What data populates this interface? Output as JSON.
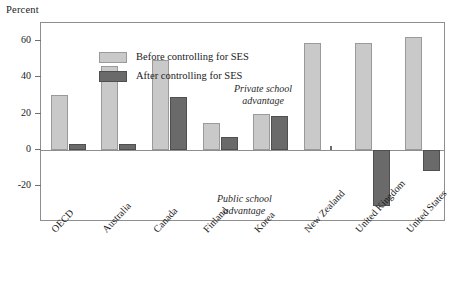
{
  "chart_data": {
    "type": "bar",
    "title": "",
    "subtitle": "",
    "xlabel": "",
    "ylabel": "Percent",
    "ylim": [
      -40,
      70
    ],
    "yticks": [
      60,
      40,
      20,
      0,
      -20
    ],
    "ytick_labels": [
      "60",
      "40",
      "20",
      "0",
      "-20"
    ],
    "grid": false,
    "legend_position": "top-left-inside",
    "categories": [
      "OECD",
      "Australia",
      "Canada",
      "Finland",
      "Korea",
      "New Zealand",
      "United Kingdom",
      "United States"
    ],
    "series": [
      {
        "name": "Before controlling for SES",
        "color": "#c9c9c9",
        "values": [
          30,
          46,
          49.5,
          14.5,
          19.5,
          59,
          59,
          62.5
        ]
      },
      {
        "name": "After controlling for SES",
        "color": "#6a6a6a",
        "values": [
          3,
          3,
          29,
          7,
          18.5,
          0,
          -31,
          -12
        ]
      }
    ],
    "annotations": [
      {
        "id": "private",
        "line1": "Private school",
        "line2": "advantage"
      },
      {
        "id": "public",
        "line1": "Public school",
        "line2": "advantage"
      }
    ]
  },
  "axis": {
    "y_title": "Percent"
  },
  "legend": {
    "items": [
      {
        "key": "before",
        "label": "Before controlling for SES"
      },
      {
        "key": "after",
        "label": "After controlling for SES"
      }
    ]
  },
  "colors": {
    "before_fill": "#c9c9c9",
    "after_fill": "#6a6a6a",
    "frame": "#8e8e8e",
    "background": "#ffffff",
    "text": "#1a1a1a"
  }
}
